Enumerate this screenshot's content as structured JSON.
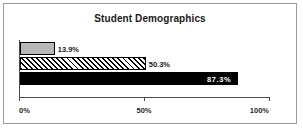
{
  "chart_data": {
    "type": "bar",
    "orientation": "horizontal",
    "title": "Student Demographics",
    "xlabel": "",
    "ylabel": "",
    "xlim": [
      0,
      100
    ],
    "grid": false,
    "legend": false,
    "categories": [
      "Series 1",
      "Series 2",
      "Series 3"
    ],
    "values": [
      13.9,
      50.3,
      87.3
    ],
    "bars": [
      {
        "value": 13.9,
        "label": "13.9%",
        "fill": "gray",
        "label_position": "outside"
      },
      {
        "value": 50.3,
        "label": "50.3%",
        "fill": "hatch",
        "label_position": "outside"
      },
      {
        "value": 87.3,
        "label": "87.3%",
        "fill": "black",
        "label_position": "inside"
      }
    ],
    "xticks": [
      {
        "value": 0,
        "label": "0%"
      },
      {
        "value": 50,
        "label": "50%"
      },
      {
        "value": 100,
        "label": "100%"
      }
    ],
    "colors": {
      "gray": "#b8b8b8",
      "black": "#000000",
      "hatch_line": "#000000",
      "axis": "#4a4a4a",
      "border": "#9a9a9a",
      "background": "#ffffff",
      "text": "#1a1a1a",
      "inside_label_text": "#ffffff"
    }
  }
}
